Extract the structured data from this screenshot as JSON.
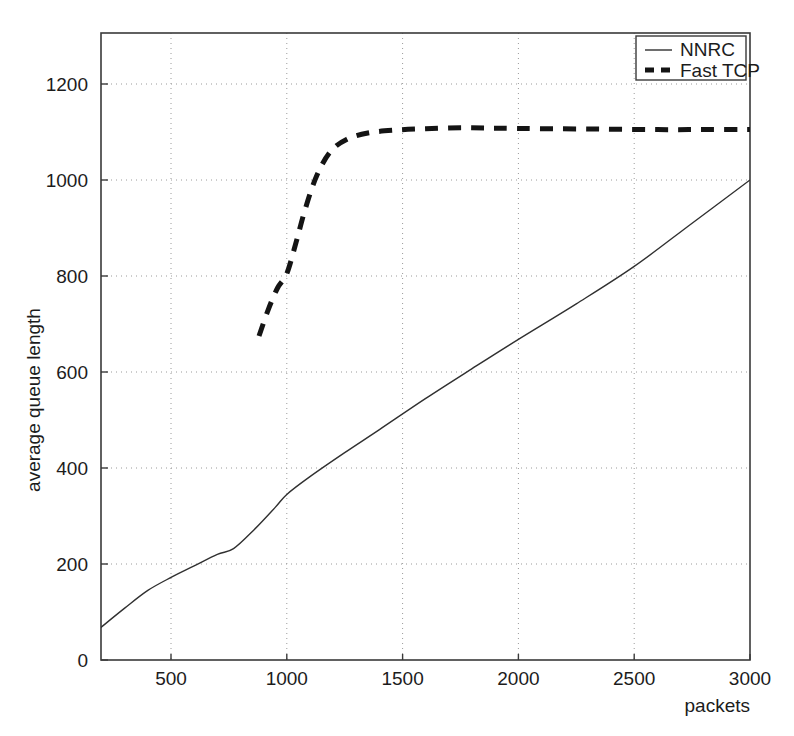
{
  "chart_data": {
    "type": "line",
    "title": "",
    "subtitle": "",
    "xlabel": "packets",
    "ylabel": "average queue length",
    "xlim": [
      190,
      3000
    ],
    "ylim": [
      0,
      1290
    ],
    "grid": true,
    "grid_style": "dotted",
    "legend_position": "top-right",
    "xticks": [
      500,
      1000,
      1500,
      2000,
      2500,
      3000
    ],
    "xtick_labels": [
      "500",
      "1000",
      "1500",
      "2000",
      "2500",
      "3000"
    ],
    "yticks": [
      0,
      200,
      400,
      600,
      800,
      1000,
      1200
    ],
    "ytick_labels": [
      "0",
      "200",
      "400",
      "600",
      "800",
      "1000",
      "1200"
    ],
    "series": [
      {
        "name": "NNRC",
        "style": "solid",
        "color": "#303030",
        "width": 1.4,
        "x": [
          190,
          300,
          400,
          500,
          600,
          700,
          770,
          860,
          950,
          1000,
          1100,
          1250,
          1400,
          1600,
          1800,
          2000,
          2250,
          2500,
          2750,
          3000
        ],
        "y": [
          65,
          108,
          145,
          172,
          196,
          220,
          232,
          272,
          318,
          345,
          382,
          432,
          480,
          545,
          607,
          668,
          742,
          820,
          910,
          1000
        ]
      },
      {
        "name": "Fast TCP",
        "style": "dashed",
        "color": "#141414",
        "width": 5,
        "x": [
          880,
          920,
          960,
          1000,
          1040,
          1080,
          1130,
          1190,
          1260,
          1350,
          1470,
          1600,
          1750,
          1900,
          2100,
          2350,
          2600,
          2800,
          3000
        ],
        "y": [
          675,
          730,
          775,
          805,
          870,
          940,
          1010,
          1060,
          1085,
          1098,
          1104,
          1107,
          1109,
          1108,
          1107,
          1106,
          1105,
          1105,
          1105
        ]
      }
    ],
    "legend_entries": [
      {
        "label": "NNRC",
        "style": "solid"
      },
      {
        "label": "Fast TCP",
        "style": "dashed"
      }
    ]
  }
}
